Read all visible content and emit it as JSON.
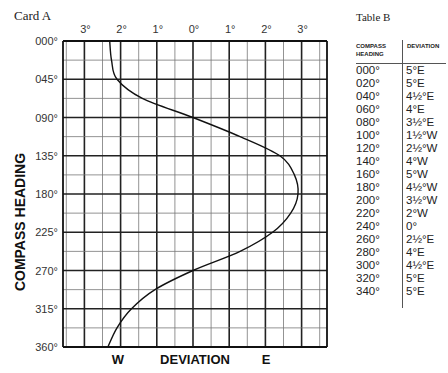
{
  "card": {
    "title": "Card A"
  },
  "table": {
    "title": "Table B",
    "headers": {
      "heading": "COMPASS HEADING",
      "deviation": "DEVIATION"
    },
    "rows": [
      {
        "heading": "000°",
        "deviation": "5°E"
      },
      {
        "heading": "020°",
        "deviation": "5°E"
      },
      {
        "heading": "040°",
        "deviation": "4½°E"
      },
      {
        "heading": "060°",
        "deviation": "4°E"
      },
      {
        "heading": "080°",
        "deviation": "3½°E"
      },
      {
        "heading": "100°",
        "deviation": "1½°W"
      },
      {
        "heading": "120°",
        "deviation": "2½°W"
      },
      {
        "heading": "140°",
        "deviation": "4°W"
      },
      {
        "heading": "160°",
        "deviation": "5°W"
      },
      {
        "heading": "180°",
        "deviation": "4½°W"
      },
      {
        "heading": "200°",
        "deviation": "3½°W"
      },
      {
        "heading": "220°",
        "deviation": "2°W"
      },
      {
        "heading": "240°",
        "deviation": "0°"
      },
      {
        "heading": "260°",
        "deviation": "2½°E"
      },
      {
        "heading": "280°",
        "deviation": "4°E"
      },
      {
        "heading": "300°",
        "deviation": "4½°E"
      },
      {
        "heading": "320°",
        "deviation": "5°E"
      },
      {
        "heading": "340°",
        "deviation": "5°E"
      }
    ]
  },
  "chart_data": {
    "type": "line",
    "title": "Card A",
    "xlabel": "DEVIATION",
    "xlabel_west": "W",
    "xlabel_east": "E",
    "ylabel": "COMPASS HEADING",
    "x_tick_labels": [
      "3°",
      "2°",
      "1°",
      "0°",
      "1°",
      "2°",
      "3°"
    ],
    "x_tick_values": [
      -3,
      -2,
      -1,
      0,
      1,
      2,
      3
    ],
    "y_tick_labels": [
      "000°",
      "045°",
      "090°",
      "135°",
      "180°",
      "225°",
      "270°",
      "315°",
      "360°"
    ],
    "y_tick_values": [
      0,
      45,
      90,
      135,
      180,
      225,
      270,
      315,
      360
    ],
    "xlim": [
      -3.5,
      3.75
    ],
    "ylim": [
      0,
      360
    ],
    "y_inverted": true,
    "grid": true,
    "grid_minor_x": 0.5,
    "grid_minor_y": 22.5,
    "sign_convention": "negative = West, positive = East",
    "series": [
      {
        "name": "deviation curve",
        "points": [
          {
            "heading": 0,
            "deviation": -2.3
          },
          {
            "heading": 22.5,
            "deviation": -2.25
          },
          {
            "heading": 45,
            "deviation": -2.1
          },
          {
            "heading": 67.5,
            "deviation": -1.4
          },
          {
            "heading": 90,
            "deviation": 0
          },
          {
            "heading": 112.5,
            "deviation": 1.3
          },
          {
            "heading": 135,
            "deviation": 2.4
          },
          {
            "heading": 157.5,
            "deviation": 2.8
          },
          {
            "heading": 180,
            "deviation": 2.9
          },
          {
            "heading": 202.5,
            "deviation": 2.7
          },
          {
            "heading": 225,
            "deviation": 2.2
          },
          {
            "heading": 247.5,
            "deviation": 1.3
          },
          {
            "heading": 270,
            "deviation": 0
          },
          {
            "heading": 292.5,
            "deviation": -1.05
          },
          {
            "heading": 315,
            "deviation": -1.7
          },
          {
            "heading": 337.5,
            "deviation": -2.1
          },
          {
            "heading": 360,
            "deviation": -2.35
          }
        ]
      }
    ]
  }
}
